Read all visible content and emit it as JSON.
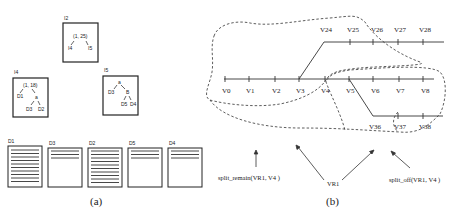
{
  "panel_a": {
    "caption": "(a)",
    "nodes": {
      "I2": {
        "title": "I2",
        "root": "(1, 25)",
        "children": [
          "I4",
          "I5"
        ]
      },
      "I4": {
        "title": "I4",
        "root": "(1, 18)",
        "left": "D1",
        "mid": "a",
        "leaves": [
          "D3",
          "D2"
        ]
      },
      "I5": {
        "title": "I5",
        "root": "a",
        "left": "D3",
        "mid": "B",
        "leaves": [
          "D5",
          "D4"
        ]
      }
    },
    "pages": [
      {
        "title": "D1",
        "lines": 10
      },
      {
        "title": "D3",
        "lines": 3
      },
      {
        "title": "D2",
        "lines": 10
      },
      {
        "title": "D5",
        "lines": 3
      },
      {
        "title": "D4",
        "lines": 3
      }
    ]
  },
  "panel_b": {
    "caption": "(b)",
    "top_line": {
      "labels": [
        "V24",
        "V25",
        "V26",
        "V27",
        "V28"
      ]
    },
    "mid_line": {
      "labels": [
        "V0",
        "V1",
        "V2",
        "V3",
        "V4",
        "V5",
        "V6",
        "V7",
        "V8"
      ]
    },
    "bottom_line": {
      "labels": [
        "V36",
        "V37",
        "V38"
      ]
    },
    "annotations": {
      "split_remain": "split_remain(VR1, V4 )",
      "region": "VR1",
      "split_off": "split_off(VR1, V4 )"
    }
  }
}
